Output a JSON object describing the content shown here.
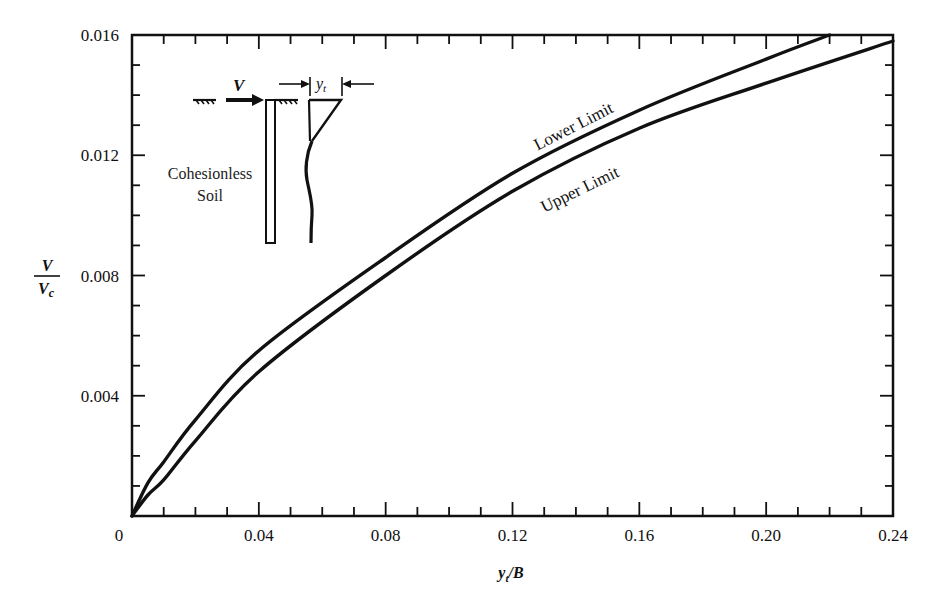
{
  "chart_data": {
    "type": "line",
    "title": "",
    "xlabel": "y_t/B",
    "ylabel": "V/V_c",
    "xlim": [
      0,
      0.24
    ],
    "ylim": [
      0,
      0.016
    ],
    "grid": false,
    "x_ticks": {
      "major": [
        0,
        0.04,
        0.08,
        0.12,
        0.16,
        0.2,
        0.24
      ],
      "labels": [
        "0",
        "0.04",
        "0.08",
        "0.12",
        "0.16",
        "0.20",
        "0.24"
      ],
      "minor_step": 0.01
    },
    "y_ticks": {
      "major": [
        0.004,
        0.008,
        0.012,
        0.016
      ],
      "labels": [
        "0.004",
        "0.008",
        "0.012",
        "0.016"
      ],
      "minor_step": 0.001
    },
    "series": [
      {
        "name": "Lower Limit",
        "x": [
          0,
          0.005,
          0.01,
          0.02,
          0.04,
          0.08,
          0.12,
          0.16,
          0.2,
          0.22
        ],
        "y": [
          0,
          0.0011,
          0.0018,
          0.0032,
          0.0055,
          0.0086,
          0.0114,
          0.0135,
          0.0152,
          0.016
        ]
      },
      {
        "name": "Upper Limit",
        "x": [
          0,
          0.005,
          0.01,
          0.02,
          0.04,
          0.08,
          0.12,
          0.16,
          0.2,
          0.24
        ],
        "y": [
          0,
          0.0007,
          0.0012,
          0.0025,
          0.0048,
          0.008,
          0.0108,
          0.0129,
          0.0144,
          0.0158
        ]
      }
    ],
    "annotations": [
      {
        "text": "Lower Limit",
        "x": 0.14,
        "y": 0.0128,
        "rotation": -27
      },
      {
        "text": "Upper Limit",
        "x": 0.142,
        "y": 0.0107,
        "rotation": -26
      }
    ]
  },
  "axes": {
    "x_title_main": "y",
    "x_title_sub": "t",
    "x_title_rest": "/B",
    "y_title_num": "V",
    "y_title_den": "V",
    "y_title_den_sub": "c"
  },
  "inset": {
    "load_label": "V",
    "deflection_label": "y",
    "deflection_sub": "t",
    "soil_line1": "Cohesionless",
    "soil_line2": "Soil"
  },
  "style": {
    "line_color": "#111111",
    "background": "#ffffff"
  }
}
